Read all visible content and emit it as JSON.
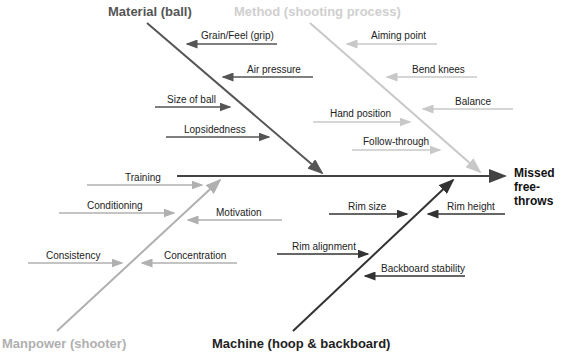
{
  "diagram": {
    "type": "fishbone",
    "effect": {
      "line1": "Missed",
      "line2": "free-throws"
    },
    "colors": {
      "material": "#555555",
      "method": "#c8c8c8",
      "manpower": "#b0b0b0",
      "machine": "#333333",
      "spine": "#444444"
    },
    "categories": {
      "material": {
        "label": "Material (ball)",
        "causes": [
          "Grain/Feel (grip)",
          "Air pressure",
          "Size of ball",
          "Lopsidedness"
        ]
      },
      "method": {
        "label": "Method (shooting process)",
        "causes": [
          "Aiming point",
          "Bend knees",
          "Balance",
          "Hand position",
          "Follow-through"
        ]
      },
      "manpower": {
        "label": "Manpower (shooter)",
        "causes": [
          "Training",
          "Conditioning",
          "Motivation",
          "Consistency",
          "Concentration"
        ]
      },
      "machine": {
        "label": "Machine (hoop & backboard)",
        "causes": [
          "Rim size",
          "Rim height",
          "Rim alignment",
          "Backboard stability"
        ]
      }
    }
  }
}
